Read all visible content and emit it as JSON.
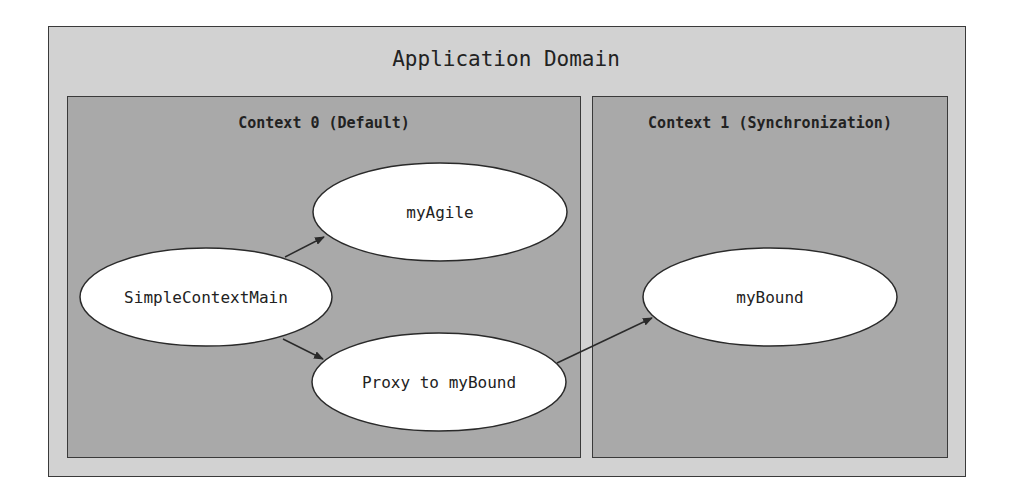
{
  "diagram": {
    "title": "Application Domain",
    "contexts": [
      {
        "label": "Context 0 (Default)"
      },
      {
        "label": "Context 1 (Synchronization)"
      }
    ],
    "nodes": [
      {
        "id": "simple_context_main",
        "label": "SimpleContextMain",
        "context": 0
      },
      {
        "id": "my_agile",
        "label": "myAgile",
        "context": 0
      },
      {
        "id": "proxy",
        "label": "Proxy to myBound",
        "context": 0
      },
      {
        "id": "my_bound",
        "label": "myBound",
        "context": 1
      }
    ],
    "edges": [
      {
        "from": "SimpleContextMain",
        "to": "myAgile"
      },
      {
        "from": "SimpleContextMain",
        "to": "Proxy to myBound"
      },
      {
        "from": "Proxy to myBound",
        "to": "myBound"
      }
    ],
    "colors": {
      "outer_fill": "#d2d2d2",
      "context_fill": "#a9a9a9",
      "node_fill": "#ffffff",
      "stroke": "#2a2a2a"
    }
  }
}
